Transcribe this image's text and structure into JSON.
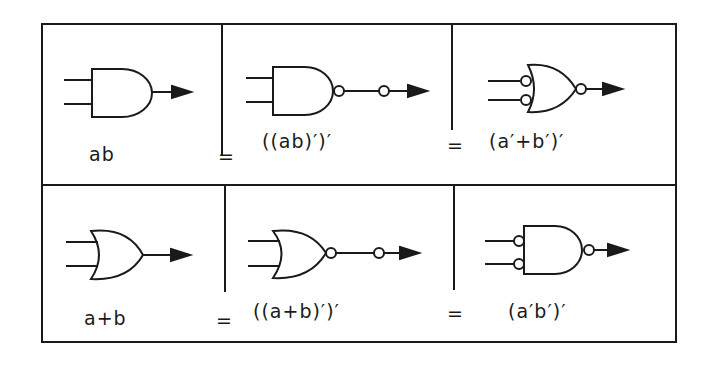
{
  "figure": {
    "rows": [
      {
        "cells": [
          {
            "gate": "AND",
            "input_bubbles": false,
            "output_bubbles": 0,
            "expression": "ab"
          },
          {
            "gate": "NAND",
            "input_bubbles": false,
            "output_bubbles": 2,
            "expression": "((ab)′)′"
          },
          {
            "gate": "OR",
            "input_bubbles": true,
            "output_bubbles": 1,
            "expression": "(a′+b′)′"
          }
        ],
        "equals": [
          "=",
          "="
        ]
      },
      {
        "cells": [
          {
            "gate": "OR",
            "input_bubbles": false,
            "output_bubbles": 0,
            "expression": "a+b"
          },
          {
            "gate": "NOR",
            "input_bubbles": false,
            "output_bubbles": 2,
            "expression": "((a+b)′)′"
          },
          {
            "gate": "AND",
            "input_bubbles": true,
            "output_bubbles": 1,
            "expression": "(a′b′)′"
          }
        ],
        "equals": [
          "=",
          "="
        ]
      }
    ]
  },
  "colors": {
    "stroke": "#1a1a1a",
    "background": "#ffffff"
  }
}
